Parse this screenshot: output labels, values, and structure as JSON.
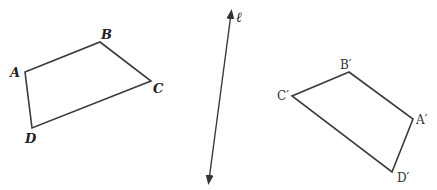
{
  "figure": {
    "original": {
      "vertices": {
        "A": [
          25,
          72
        ],
        "B": [
          100,
          42
        ],
        "C": [
          151,
          81
        ],
        "D": [
          32,
          128
        ]
      },
      "labels": {
        "A": "A",
        "B": "B",
        "C": "C",
        "D": "D"
      },
      "label_positions": {
        "A": [
          10,
          77
        ],
        "B": [
          101,
          39
        ],
        "C": [
          153,
          93
        ],
        "D": [
          25,
          143
        ]
      }
    },
    "line": {
      "label": "ℓ",
      "start": [
        231,
        14
      ],
      "end": [
        209,
        180
      ],
      "label_position": [
        237,
        22
      ]
    },
    "image": {
      "vertices": {
        "B'": [
          349,
          72
        ],
        "C'": [
          292,
          96
        ],
        "D'": [
          392,
          172
        ],
        "A'": [
          413,
          119
        ]
      },
      "labels": {
        "A": "A′",
        "B": "B′",
        "C": "C′",
        "D": "D′"
      },
      "label_positions": {
        "A": [
          415,
          124
        ],
        "B": [
          340,
          70
        ],
        "C": [
          278,
          102
        ],
        "D": [
          397,
          181
        ]
      }
    },
    "stroke_color": "#3a3a3a"
  }
}
